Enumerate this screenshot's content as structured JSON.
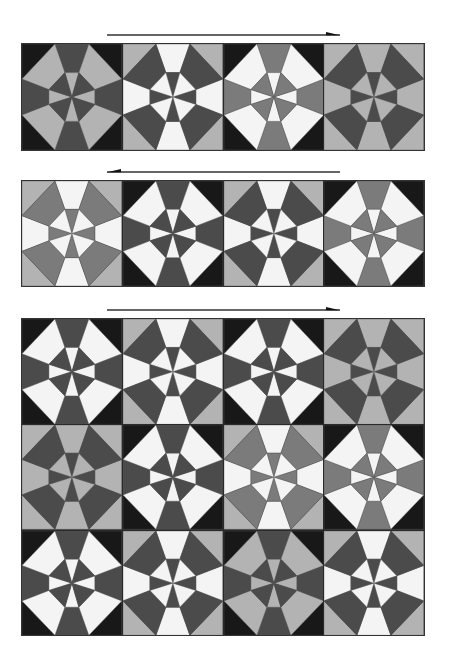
{
  "palette": {
    "black": "#181818",
    "dark": "#4b4b4b",
    "mid": "#7b7b7b",
    "light": "#b3b3b3",
    "white": "#f4f4f4"
  },
  "tile_geometry": {
    "viewbox": "0 0 100 100",
    "corner_inset": 33,
    "octagon_near": 43,
    "octagon_far": 27
  },
  "arrows": [
    {
      "direction": "right",
      "x1": 107,
      "x2": 340,
      "y": 35
    },
    {
      "direction": "left",
      "x1": 107,
      "x2": 340,
      "y": 172
    },
    {
      "direction": "right",
      "x1": 107,
      "x2": 340,
      "y": 310
    }
  ],
  "panels": [
    {
      "top": 43,
      "height": 108,
      "rows": [
        [
          {
            "corner": "black",
            "edge": "dark",
            "kite": "light"
          },
          {
            "corner": "light",
            "edge": "white",
            "kite": "dark"
          },
          {
            "corner": "black",
            "edge": "mid",
            "kite": "white"
          },
          {
            "corner": "light",
            "edge": "light",
            "kite": "dark"
          }
        ]
      ]
    },
    {
      "top": 180,
      "height": 107,
      "rows": [
        [
          {
            "corner": "light",
            "edge": "white",
            "kite": "mid"
          },
          {
            "corner": "black",
            "edge": "dark",
            "kite": "white"
          },
          {
            "corner": "light",
            "edge": "white",
            "kite": "dark"
          },
          {
            "corner": "black",
            "edge": "mid",
            "kite": "white"
          }
        ]
      ]
    },
    {
      "top": 318,
      "height": 318,
      "rows": [
        [
          {
            "corner": "black",
            "edge": "dark",
            "kite": "white"
          },
          {
            "corner": "light",
            "edge": "white",
            "kite": "dark"
          },
          {
            "corner": "black",
            "edge": "dark",
            "kite": "white"
          },
          {
            "corner": "light",
            "edge": "light",
            "kite": "dark"
          }
        ],
        [
          {
            "corner": "light",
            "edge": "light",
            "kite": "dark"
          },
          {
            "corner": "black",
            "edge": "dark",
            "kite": "white"
          },
          {
            "corner": "light",
            "edge": "white",
            "kite": "mid"
          },
          {
            "corner": "black",
            "edge": "mid",
            "kite": "white"
          }
        ],
        [
          {
            "corner": "black",
            "edge": "dark",
            "kite": "white"
          },
          {
            "corner": "light",
            "edge": "white",
            "kite": "dark"
          },
          {
            "corner": "black",
            "edge": "dark",
            "kite": "light"
          },
          {
            "corner": "light",
            "edge": "white",
            "kite": "dark"
          }
        ]
      ]
    }
  ]
}
